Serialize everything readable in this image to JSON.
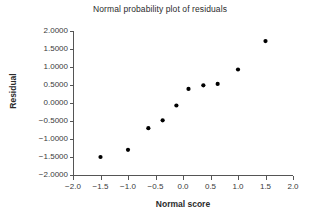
{
  "chart_data": {
    "type": "scatter",
    "title": "Normal probability plot of residuals",
    "xlabel": "Normal score",
    "ylabel": "Residual",
    "xlim": [
      -2.0,
      2.0
    ],
    "ylim": [
      -2.0,
      2.0
    ],
    "xticks": [
      -2.0,
      -1.5,
      -1.0,
      -0.5,
      0.0,
      0.5,
      1.0,
      1.5,
      2.0
    ],
    "xtick_labels": [
      "-2.0",
      "-1.5",
      "-1.0",
      "-0.5",
      "0.0",
      "0.5",
      "1.0",
      "1.5",
      "2.0"
    ],
    "yticks": [
      2.0,
      1.5,
      1.0,
      0.5,
      0.0,
      -0.5,
      -1.0,
      -1.5,
      -2.0
    ],
    "ytick_labels": [
      "2.0000",
      "1.5000",
      "1.0000",
      "0.5000",
      "0.0000",
      "-0.5000",
      "-1.0000",
      "-1.5000",
      "-2.0000"
    ],
    "grid": false,
    "legend": false,
    "marker_color": "#000000",
    "axis_color": "#555555",
    "series": [
      {
        "name": "residuals",
        "points": [
          {
            "x": -1.5,
            "y": -1.5
          },
          {
            "x": -1.0,
            "y": -1.3
          },
          {
            "x": -0.63,
            "y": -0.7
          },
          {
            "x": -0.37,
            "y": -0.48
          },
          {
            "x": -0.12,
            "y": -0.07
          },
          {
            "x": 0.1,
            "y": 0.39
          },
          {
            "x": 0.37,
            "y": 0.49
          },
          {
            "x": 0.63,
            "y": 0.53
          },
          {
            "x": 1.0,
            "y": 0.93
          },
          {
            "x": 1.5,
            "y": 1.72
          }
        ]
      }
    ]
  }
}
